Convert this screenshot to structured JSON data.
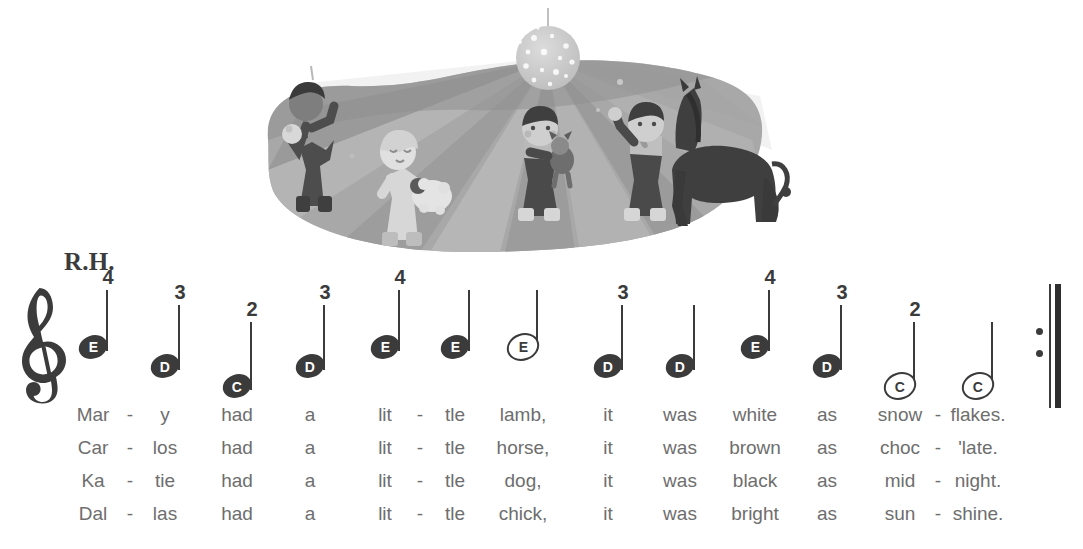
{
  "illustration": {
    "name": "children-dancing-disco-illustration",
    "description": "Four children dancing with a lamb, a dog, a chick and a horse under a disco ball with light rays",
    "elements": [
      "disco-ball",
      "light-rays",
      "boy-with-chick",
      "girl-with-lamb",
      "girl-with-dog",
      "boy-waving",
      "horse"
    ],
    "palette": {
      "stage_dark": "#8f8f8f",
      "stage_mid": "#a3a3a3",
      "stage_light": "#bcbcbc",
      "ray": "#d8d8d8",
      "ball": "#c9c9c9",
      "figure_dark": "#4f4f4f",
      "figure_light": "#d2d2d2"
    }
  },
  "score": {
    "hand_label": "R.H.",
    "clef": "treble-clef",
    "barline": "repeat-barline-end",
    "ink_color": "#3b3b3b",
    "lyric_color": "#6e6e6e",
    "notes": [
      {
        "letter": "E",
        "finger": "4",
        "head": "filled",
        "x": 93,
        "head_y": 347,
        "stem_top": 290
      },
      {
        "letter": "D",
        "finger": "3",
        "head": "filled",
        "x": 165,
        "head_y": 366,
        "stem_top": 305
      },
      {
        "letter": "C",
        "finger": "2",
        "head": "filled",
        "x": 237,
        "head_y": 386,
        "stem_top": 322
      },
      {
        "letter": "D",
        "finger": "3",
        "head": "filled",
        "x": 310,
        "head_y": 366,
        "stem_top": 305
      },
      {
        "letter": "E",
        "finger": "4",
        "head": "filled",
        "x": 385,
        "head_y": 347,
        "stem_top": 290
      },
      {
        "letter": "E",
        "finger": "",
        "head": "filled",
        "x": 455,
        "head_y": 347,
        "stem_top": 290
      },
      {
        "letter": "E",
        "finger": "",
        "head": "hollow",
        "x": 523,
        "head_y": 347,
        "stem_top": 290
      },
      {
        "letter": "D",
        "finger": "3",
        "head": "filled",
        "x": 608,
        "head_y": 366,
        "stem_top": 305
      },
      {
        "letter": "D",
        "finger": "",
        "head": "filled",
        "x": 680,
        "head_y": 366,
        "stem_top": 305
      },
      {
        "letter": "E",
        "finger": "4",
        "head": "filled",
        "x": 755,
        "head_y": 347,
        "stem_top": 290
      },
      {
        "letter": "D",
        "finger": "3",
        "head": "filled",
        "x": 827,
        "head_y": 366,
        "stem_top": 305
      },
      {
        "letter": "C",
        "finger": "2",
        "head": "hollow",
        "x": 900,
        "head_y": 386,
        "stem_top": 322
      },
      {
        "letter": "C",
        "finger": "",
        "head": "hollow",
        "x": 978,
        "head_y": 386,
        "stem_top": 322
      }
    ]
  },
  "lyrics": {
    "columns_x": [
      93,
      130,
      165,
      237,
      310,
      385,
      420,
      455,
      523,
      608,
      680,
      755,
      827,
      900,
      938,
      978
    ],
    "verses": [
      {
        "syllables": [
          "Mar",
          "-",
          "y",
          "had",
          "a",
          "lit",
          "-",
          "tle",
          "lamb,",
          "it",
          "was",
          "white",
          "as",
          "snow",
          "-",
          "flakes."
        ]
      },
      {
        "syllables": [
          "Car",
          "-",
          "los",
          "had",
          "a",
          "lit",
          "-",
          "tle",
          "horse,",
          "it",
          "was",
          "brown",
          "as",
          "choc",
          "-",
          "'late."
        ]
      },
      {
        "syllables": [
          "Ka",
          "-",
          "tie",
          "had",
          "a",
          "lit",
          "-",
          "tle",
          "dog,",
          "it",
          "was",
          "black",
          "as",
          "mid",
          "-",
          "night."
        ]
      },
      {
        "syllables": [
          "Dal",
          "-",
          "las",
          "had",
          "a",
          "lit",
          "-",
          "tle",
          "chick,",
          "it",
          "was",
          "bright",
          "as",
          "sun",
          "-",
          "shine."
        ]
      }
    ]
  }
}
